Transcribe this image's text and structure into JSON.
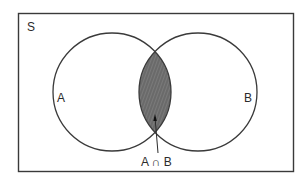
{
  "diagram": {
    "type": "venn",
    "universe_label": "S",
    "set_a_label": "A",
    "set_b_label": "B",
    "intersection_label": "A ∩ B",
    "colors": {
      "stroke": "#3a3a3a",
      "shade": "#6e6e6e",
      "background": "#ffffff"
    }
  }
}
